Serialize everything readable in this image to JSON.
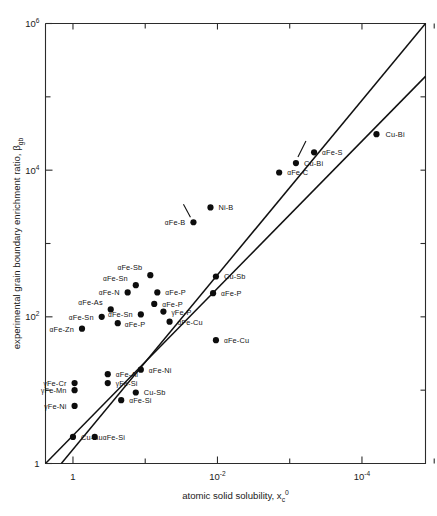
{
  "chart_data": {
    "type": "scatter",
    "title": "",
    "xlabel": "atomic solid solubility, xᶜ⁰",
    "xlabel_text": "atomic solid solubility, x",
    "xlabel_sub": "c",
    "xlabel_sup": "0",
    "ylabel_text": "experimental grain boundary enrichment ratio, β",
    "ylabel_sub": "gb",
    "x_scale": "log",
    "y_scale": "log",
    "x_reversed": true,
    "xlim": [
      2.4,
      1.32e-05
    ],
    "ylim": [
      1,
      1000000
    ],
    "grid": false,
    "legend": "none",
    "x_ticks_major": [
      {
        "value": 1,
        "label": "1",
        "mantissa": "1",
        "exponent": ""
      },
      {
        "value": 0.01,
        "label": "10⁻²",
        "mantissa": "10",
        "exponent": "-2"
      },
      {
        "value": 0.0001,
        "label": "10⁻⁴",
        "mantissa": "10",
        "exponent": "-4"
      }
    ],
    "x_ticks_minor": [
      0.1,
      0.001,
      1e-05
    ],
    "y_ticks_major": [
      {
        "value": 1,
        "label": "1",
        "mantissa": "1",
        "exponent": ""
      },
      {
        "value": 100,
        "label": "10²",
        "mantissa": "10",
        "exponent": "2"
      },
      {
        "value": 10000,
        "label": "10⁴",
        "mantissa": "10",
        "exponent": "4"
      },
      {
        "value": 1000000,
        "label": "10⁶",
        "mantissa": "10",
        "exponent": "6"
      }
    ],
    "y_ticks_minor": [
      10,
      1000,
      100000
    ],
    "reference_lines": [
      {
        "name": "upper-diagonal",
        "x1": 1.45,
        "y1": 1.0,
        "x2": 1.32e-05,
        "y2": 1000000
      },
      {
        "name": "lower-diagonal",
        "x1": 2.4,
        "y1": 1.0,
        "x2": 1.32e-05,
        "y2": 190000
      }
    ],
    "points": [
      {
        "label": "Cu-Bi",
        "prefix": "",
        "x": 6.3e-05,
        "y": 31000,
        "label_dx": 9,
        "label_dy": 3,
        "anchor": "start",
        "leader": null
      },
      {
        "label": "αFe-S",
        "prefix": "α",
        "x": 0.00046,
        "y": 17500,
        "label_dx": 8,
        "label_dy": 3,
        "anchor": "start",
        "leader": null
      },
      {
        "label": "Cu-Bi",
        "prefix": "",
        "x": 0.00082,
        "y": 12500,
        "label_dx": 8,
        "label_dy": 3,
        "anchor": "start",
        "leader": [
          2,
          -6,
          10,
          -22
        ]
      },
      {
        "label": "αFe-C",
        "prefix": "α",
        "x": 0.0014,
        "y": 9300,
        "label_dx": 8,
        "label_dy": 3,
        "anchor": "start",
        "leader": null
      },
      {
        "label": "Ni-B",
        "prefix": "",
        "x": 0.0125,
        "y": 3100,
        "label_dx": 8,
        "label_dy": 3,
        "anchor": "start",
        "leader": null
      },
      {
        "label": "αFe-B",
        "prefix": "α",
        "x": 0.0215,
        "y": 1950,
        "label_dx": -8,
        "label_dy": 3,
        "anchor": "end",
        "leader": [
          -3,
          -5,
          -10,
          -18
        ]
      },
      {
        "label": "αFe-Sb",
        "prefix": "α",
        "x": 0.085,
        "y": 370,
        "label_dx": -8,
        "label_dy": -5,
        "anchor": "end",
        "leader": null
      },
      {
        "label": "Cu-Sb",
        "prefix": "",
        "x": 0.0105,
        "y": 355,
        "label_dx": 8,
        "label_dy": 3,
        "anchor": "start",
        "leader": null
      },
      {
        "label": "αFe-Sn",
        "prefix": "α",
        "x": 0.135,
        "y": 270,
        "label_dx": -8,
        "label_dy": -4,
        "anchor": "end",
        "leader": null
      },
      {
        "label": "αFe-N",
        "prefix": "α",
        "x": 0.175,
        "y": 215,
        "label_dx": -8,
        "label_dy": 3,
        "anchor": "end",
        "leader": null
      },
      {
        "label": "αFe-P",
        "prefix": "α",
        "x": 0.068,
        "y": 215,
        "label_dx": 8,
        "label_dy": 3,
        "anchor": "start",
        "leader": null
      },
      {
        "label": "αFe-P",
        "prefix": "α",
        "x": 0.0115,
        "y": 210,
        "label_dx": 8,
        "label_dy": 3,
        "anchor": "start",
        "leader": null
      },
      {
        "label": "αFe-P",
        "prefix": "α",
        "x": 0.075,
        "y": 150,
        "label_dx": 8,
        "label_dy": 3,
        "anchor": "start",
        "leader": null
      },
      {
        "label": "γFe-P",
        "prefix": "γ",
        "x": 0.056,
        "y": 118,
        "label_dx": 8,
        "label_dy": 3,
        "anchor": "start",
        "leader": null
      },
      {
        "label": "αFe-As",
        "prefix": "α",
        "x": 0.3,
        "y": 126,
        "label_dx": -8,
        "label_dy": -4,
        "anchor": "end",
        "leader": null
      },
      {
        "label": "αFe-Sn",
        "prefix": "α",
        "x": 0.115,
        "y": 108,
        "label_dx": -8,
        "label_dy": 3,
        "anchor": "end",
        "leader": null
      },
      {
        "label": "αFe-Sn",
        "prefix": "α",
        "x": 0.4,
        "y": 100,
        "label_dx": -8,
        "label_dy": 3,
        "anchor": "end",
        "leader": null
      },
      {
        "label": "αFe-P",
        "prefix": "α",
        "x": 0.24,
        "y": 82,
        "label_dx": 7,
        "label_dy": 4,
        "anchor": "start",
        "leader": null
      },
      {
        "label": "αFe-Cu",
        "prefix": "α",
        "x": 0.046,
        "y": 86,
        "label_dx": 8,
        "label_dy": 3,
        "anchor": "start",
        "leader": null
      },
      {
        "label": "αFe-Zn",
        "prefix": "α",
        "x": 0.75,
        "y": 69,
        "label_dx": -8,
        "label_dy": 3,
        "anchor": "end",
        "leader": null
      },
      {
        "label": "αFe-Cu",
        "prefix": "α",
        "x": 0.0105,
        "y": 48,
        "label_dx": 8,
        "label_dy": 3,
        "anchor": "start",
        "leader": null
      },
      {
        "label": "αFe-Ni",
        "prefix": "α",
        "x": 0.115,
        "y": 19,
        "label_dx": 8,
        "label_dy": 3,
        "anchor": "start",
        "leader": null
      },
      {
        "label": "αFe-Al",
        "prefix": "α",
        "x": 0.33,
        "y": 16.5,
        "label_dx": 8,
        "label_dy": 3,
        "anchor": "start",
        "leader": null
      },
      {
        "label": "γFe-Cr",
        "prefix": "γ",
        "x": 0.95,
        "y": 12.5,
        "label_dx": -8,
        "label_dy": 3,
        "anchor": "end",
        "leader": null
      },
      {
        "label": "γFe-Si",
        "prefix": "γ",
        "x": 0.33,
        "y": 12.5,
        "label_dx": 8,
        "label_dy": 3,
        "anchor": "start",
        "leader": null
      },
      {
        "label": "γFe-Mn",
        "prefix": "γ",
        "x": 0.95,
        "y": 10.0,
        "label_dx": -8,
        "label_dy": 3,
        "anchor": "end",
        "leader": null
      },
      {
        "label": "Cu-Sb",
        "prefix": "",
        "x": 0.135,
        "y": 9.3,
        "label_dx": 8,
        "label_dy": 3,
        "anchor": "start",
        "leader": null
      },
      {
        "label": "αFe-Si",
        "prefix": "α",
        "x": 0.215,
        "y": 7.3,
        "label_dx": 8,
        "label_dy": 3,
        "anchor": "start",
        "leader": null
      },
      {
        "label": "γFe-Ni",
        "prefix": "γ",
        "x": 0.95,
        "y": 6.1,
        "label_dx": -8,
        "label_dy": 3,
        "anchor": "end",
        "leader": null
      },
      {
        "label": "Cu-Au",
        "prefix": "",
        "x": 1.0,
        "y": 2.3,
        "label_dx": 8,
        "label_dy": 3,
        "anchor": "start",
        "leader": null
      },
      {
        "label": "αFe-Si",
        "prefix": "α",
        "x": 0.5,
        "y": 2.3,
        "label_dx": 8,
        "label_dy": 3,
        "anchor": "start",
        "leader": null
      }
    ]
  },
  "figure": {
    "x_axis_title_text": "atomic solid solubility, x",
    "x_axis_title_sub": "c",
    "x_axis_title_sup": "0",
    "y_axis_title_text": "experimental grain boundary enrichment ratio, β",
    "y_axis_title_sub": "gb"
  }
}
